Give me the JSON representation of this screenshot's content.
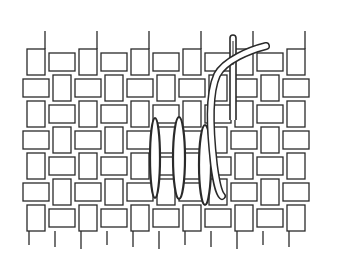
{
  "figure": {
    "description": "Satin stitch on plain-weave fabric with needle and thread",
    "colors": {
      "background": "#ffffff",
      "line": "#2a2a2a",
      "thread_fill": "#ffffff"
    },
    "weave": {
      "origin_x": 36,
      "origin_y": 62,
      "cell_w": 26,
      "cell_h": 26,
      "cols": 11,
      "rows": 7,
      "thread_w": 18,
      "stroke_w": 1.3
    },
    "stitches": [
      {
        "cx": 155,
        "cy": 158,
        "rx": 5,
        "ry": 40
      },
      {
        "cx": 179,
        "cy": 158,
        "rx": 6,
        "ry": 41
      },
      {
        "cx": 205,
        "cy": 165,
        "rx": 6,
        "ry": 40
      }
    ],
    "needle": {
      "x": 233,
      "top": 35,
      "bottom": 120,
      "w": 6
    },
    "thread": {
      "path": "M 266 46 C 250 50, 225 60, 217 75 C 208 95, 210 130, 214 165 C 216 180, 218 192, 222 196"
    }
  }
}
